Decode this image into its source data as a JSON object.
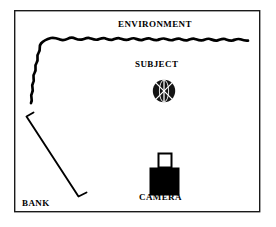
{
  "figure": {
    "kind": "lighting-setup-diagram",
    "background_color": "#ffffff",
    "ink_color": "#000000",
    "border_color": "#000000"
  },
  "labels": {
    "environment": "ENVIRONMENT",
    "subject": "SUBJECT",
    "camera": "CAMERA",
    "bank_light_line1": "BANK",
    "bank_light_line2": "LIGHT"
  },
  "elements": {
    "frame": {
      "name": "diagram-border",
      "x": 14,
      "y": 10,
      "width": 246,
      "height": 202,
      "stroke": "#000000",
      "stroke_width": 1.4
    },
    "environment_wall": {
      "name": "wavy-environment-line",
      "description": "squiggly line rising up the left side then running across the top",
      "stroke": "#000000",
      "stroke_width": 2.6
    },
    "subject": {
      "name": "subject-sphere",
      "cx": 164,
      "cy": 91,
      "r": 11,
      "fill": "#111111",
      "marking": "white cross and X meridian lines"
    },
    "bank_light": {
      "name": "bank-light-bar",
      "x1": 27,
      "y1": 115,
      "x2": 78,
      "y2": 196,
      "stroke": "#000000",
      "stroke_width": 1.8,
      "end_ticks": true
    },
    "camera": {
      "name": "camera-body",
      "body_x": 150,
      "body_y": 170,
      "body_width": 28,
      "body_height": 25,
      "fill": "#000000",
      "lens_x": 158,
      "lens_y": 153,
      "lens_width": 13,
      "lens_height": 14,
      "lens_fill": "#ffffff"
    }
  }
}
